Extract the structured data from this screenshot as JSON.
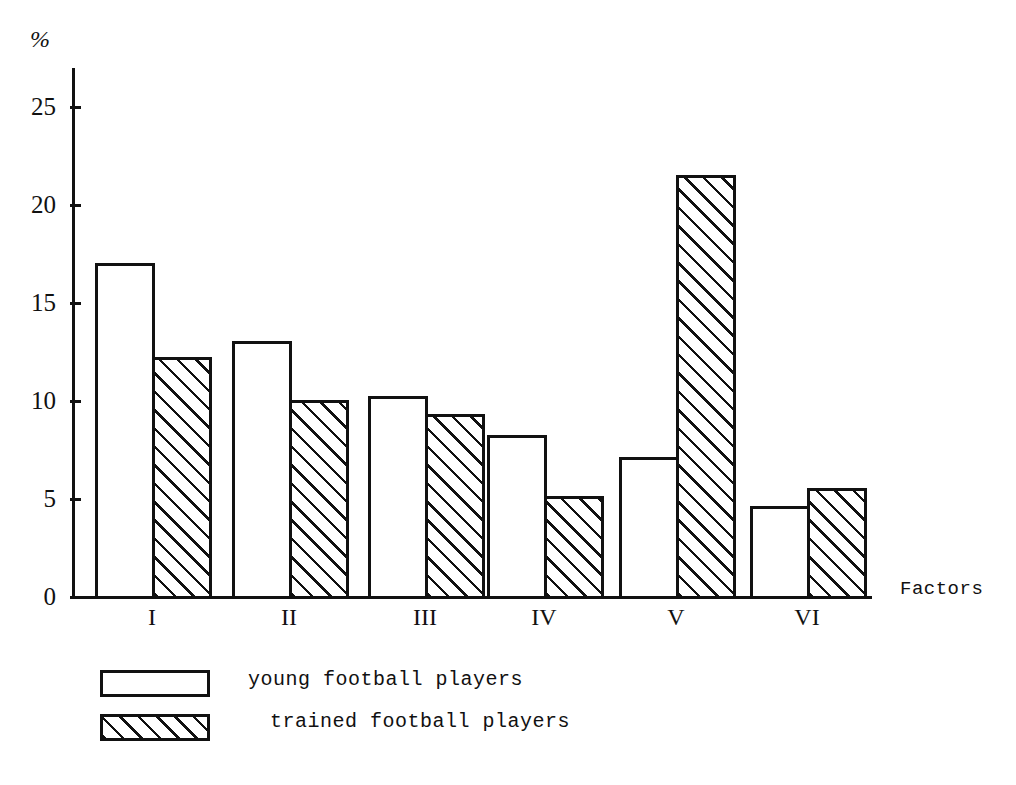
{
  "chart_data": {
    "type": "bar",
    "title": "",
    "xlabel": "Factors",
    "ylabel": "%",
    "categories": [
      "I",
      "II",
      "III",
      "IV",
      "V",
      "VI"
    ],
    "series": [
      {
        "name": "young football players",
        "pattern": "white",
        "values": [
          17.0,
          13.0,
          10.2,
          8.2,
          7.1,
          4.6
        ]
      },
      {
        "name": "trained football players",
        "pattern": "hatched",
        "values": [
          12.2,
          10.0,
          9.3,
          5.1,
          21.5,
          5.5
        ]
      }
    ],
    "yticks": [
      0,
      5,
      10,
      15,
      20,
      25
    ],
    "ylim": [
      0,
      26.5
    ],
    "grid": false,
    "legend_position": "bottom-left"
  },
  "axes": {
    "y_unit_label": "%",
    "x_axis_title": "Factors",
    "tick_labels": [
      "0",
      "5",
      "10",
      "15",
      "20",
      "25"
    ],
    "category_labels": [
      "I",
      "II",
      "III",
      "IV",
      "V",
      "VI"
    ]
  },
  "legend": {
    "entries": [
      {
        "label": "young football players",
        "swatch": "white-rectangle"
      },
      {
        "label": "trained football players",
        "swatch": "hatched-rectangle"
      }
    ]
  }
}
